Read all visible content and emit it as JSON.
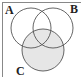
{
  "diagram": {
    "type": "venn",
    "sets": [
      {
        "label": "A",
        "shaded": false
      },
      {
        "label": "B",
        "shaded": false
      },
      {
        "label": "C",
        "shaded": true
      }
    ],
    "labels": {
      "a": "A",
      "b": "B",
      "c": "C"
    },
    "shaded_region": "C",
    "colors": {
      "stroke": "#555555",
      "shade": "#e6e6e6",
      "border": "#888888",
      "background": "#ffffff"
    }
  }
}
